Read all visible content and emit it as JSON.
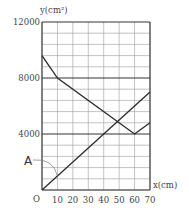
{
  "chart_data": {
    "type": "line",
    "title": "",
    "xlabel": "x(cm)",
    "ylabel": "y(cm²)",
    "origin_label": "O",
    "xlim": [
      0,
      70
    ],
    "ylim": [
      0,
      12000
    ],
    "x_ticks": [
      10,
      20,
      30,
      40,
      50,
      60,
      70
    ],
    "x_tick_labels": [
      "10",
      "20",
      "30",
      "40",
      "50",
      "60",
      "70"
    ],
    "y_ticks": [
      4000,
      8000,
      12000
    ],
    "y_tick_labels": [
      "4000",
      "8000",
      "12000"
    ],
    "grid": {
      "on": true,
      "x_step": 10,
      "y_step": 800,
      "bold_y": [
        4000,
        8000
      ]
    },
    "series": [
      {
        "name": "A",
        "x": [
          0,
          70
        ],
        "y": [
          0,
          7000
        ]
      },
      {
        "name": "unlabeled",
        "x": [
          0,
          10,
          60,
          70
        ],
        "y": [
          9600,
          8000,
          4000,
          4800
        ]
      }
    ],
    "annotations": [
      {
        "text": "A",
        "points_to_series": "A",
        "at_x": 10
      }
    ],
    "legend": {
      "position": "none"
    }
  },
  "colors": {
    "line": "#2b2b2b",
    "grid": "#9a9a9a",
    "text": "#444444"
  }
}
